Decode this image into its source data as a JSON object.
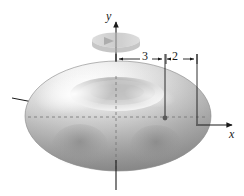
{
  "figure": {
    "name": "torus-solid-of-revolution",
    "background_color": "#ffffff",
    "stroke_color": "#1a1a1a",
    "surface_light_color": "#fdfdfd",
    "surface_mid_color": "#c8c8c8",
    "surface_dark_color": "#8e8e8e",
    "rotation_arrow_color": "#bdbdbd"
  },
  "axes": {
    "y": {
      "label": "y",
      "direction": "up",
      "arrow": true
    },
    "x": {
      "label": "x",
      "direction": "right",
      "arrow": true
    },
    "z": {
      "label": "",
      "direction": "upper-left",
      "arrow": false
    }
  },
  "dimensions": [
    {
      "name": "inner-offset",
      "label": "3",
      "from": "y-axis",
      "to": "tube-center"
    },
    {
      "name": "tube-radius",
      "label": "2",
      "from": "tube-center",
      "to": "outer-edge"
    }
  ],
  "markers": {
    "tube_center_dot": "center-point"
  },
  "annotations": {
    "rotation_indicator": "revolution-about-y-axis"
  }
}
